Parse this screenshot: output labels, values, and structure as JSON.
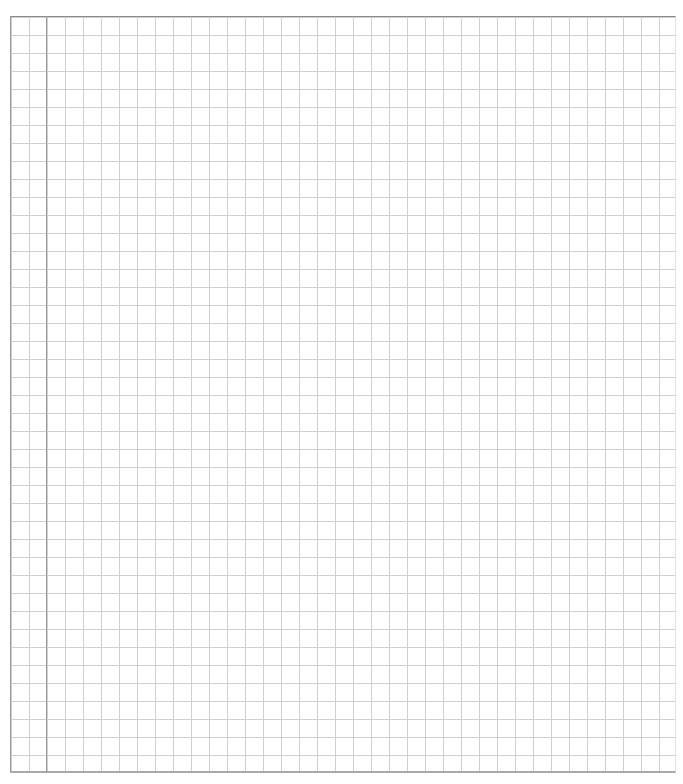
{
  "page": {
    "type": "graph-paper",
    "grid_cell_px": 18,
    "colors": {
      "background": "#ffffff",
      "grid_line": "#cfcfcf",
      "border": "#9a9a9a",
      "margin_line": "#9a9a9a"
    }
  }
}
